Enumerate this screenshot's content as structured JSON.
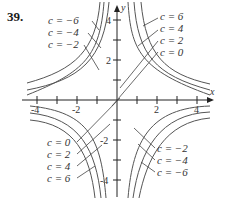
{
  "problem_number": "39.",
  "axes": {
    "x_label": "x",
    "y_label": "y",
    "x_ticks": [
      "-4",
      "-2",
      "2",
      "4"
    ],
    "y_ticks": [
      "4",
      "2",
      "-2",
      "-4"
    ]
  },
  "labels": {
    "upper_left": [
      "c = −6",
      "c = −4",
      "c = −2"
    ],
    "upper_right": [
      "c = 6",
      "c = 4",
      "c = 2",
      "c = 0"
    ],
    "lower_left": [
      "c = 0",
      "c = 2",
      "c = 4",
      "c = 6"
    ],
    "lower_right": [
      "c = −2",
      "c = −4",
      "c = −6"
    ]
  },
  "colors": {
    "curve": "#555555",
    "axis": "#222222",
    "text": "#333333"
  }
}
